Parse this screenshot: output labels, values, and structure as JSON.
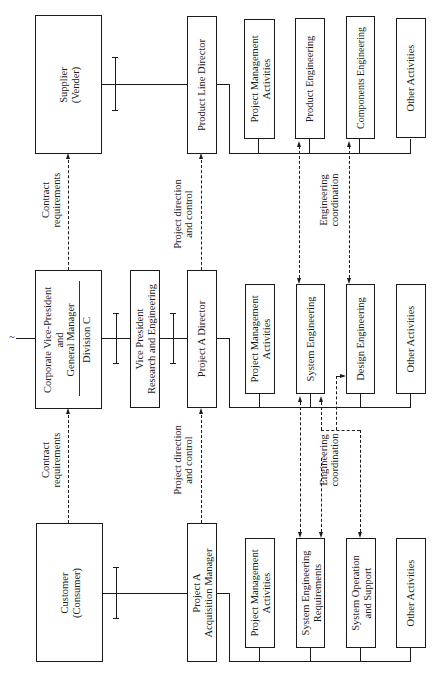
{
  "diagram": {
    "orientation": "rotated-90-ccw",
    "top_row": {
      "supplier": [
        "Supplier",
        "(Vender)"
      ],
      "product_line_director": [
        "Product Line Director"
      ],
      "activities": [
        [
          "Project Management",
          "Activities"
        ],
        [
          "Product Engineering"
        ],
        [
          "Components Engineering"
        ],
        [
          "Other Activities"
        ]
      ]
    },
    "middle_row": {
      "corporate_vp": [
        "Corporate Vice-President",
        "and",
        "General Manager"
      ],
      "division": "Division  C",
      "vp_research": [
        "Vice President",
        "Research and Engineering"
      ],
      "project_a_director": [
        "Project  A  Director"
      ],
      "activities": [
        [
          "Project Management",
          "Activities"
        ],
        [
          "System Engineering"
        ],
        [
          "Design Engineering"
        ],
        [
          "Other Activities"
        ]
      ]
    },
    "bottom_row": {
      "customer": [
        "Customer",
        "(Consumer)"
      ],
      "acquisition_manager": [
        "Project A",
        "Acquisition Manager"
      ],
      "activities": [
        [
          "Project Management",
          "Activities"
        ],
        [
          "System Engineering",
          "Requirements"
        ],
        [
          "System Operation",
          "and Support"
        ],
        [
          "Other Activities"
        ]
      ]
    },
    "relationship_labels": {
      "contract_top": [
        "Contract",
        "requirements"
      ],
      "contract_bottom": [
        "Contract",
        "requirements"
      ],
      "project_direction_top": [
        "Project direction",
        "and control"
      ],
      "project_direction_bottom": [
        "Project direction",
        "and control"
      ],
      "engineering_top": [
        "Engineering",
        "coordination"
      ],
      "engineering_bottom": [
        "Engineering",
        "coordination"
      ]
    },
    "symbols": {
      "break_mark": "≀",
      "tilde": "~"
    }
  }
}
